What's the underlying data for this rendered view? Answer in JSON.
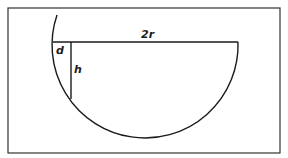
{
  "diagram": {
    "type": "geometry-figure",
    "colors": {
      "stroke": "#1a1a1a",
      "background": "#ffffff",
      "frame": "#333333"
    },
    "frame": {
      "x": 8,
      "y": 8,
      "width": 272,
      "height": 145
    },
    "circle": {
      "cx": 146,
      "cy": 44,
      "r": 93
    },
    "arc": {
      "start": [
        57,
        15
      ],
      "end": [
        238,
        42
      ]
    },
    "chord": {
      "x1": 53,
      "y1": 42,
      "x2": 238,
      "y2": 42
    },
    "height_segment": {
      "x1": 71,
      "y1": 42,
      "x2": 71,
      "y2": 99
    },
    "labels": {
      "chord": "2r",
      "offset": "d",
      "height": "h"
    },
    "label_positions": {
      "chord": [
        141,
        38
      ],
      "offset": [
        56,
        54
      ],
      "height": [
        74,
        73
      ]
    }
  }
}
